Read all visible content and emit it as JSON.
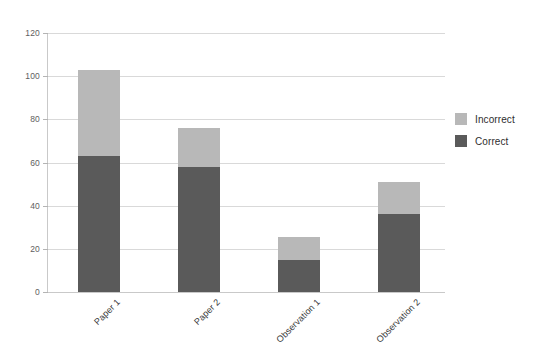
{
  "chart_data": {
    "type": "bar",
    "subtype": "stacked-vertical",
    "title": "",
    "xlabel": "",
    "ylabel": "",
    "ylim": [
      0,
      120
    ],
    "yticks": [
      0,
      20,
      40,
      60,
      80,
      100,
      120
    ],
    "ytick_labels": [
      "0",
      "20",
      "40",
      "60",
      "80",
      "100",
      "120"
    ],
    "grid": true,
    "grid_axis": "y",
    "legend_position": "right",
    "categories": [
      "Paper 1",
      "Paper 2",
      "Observation 1",
      "Observation 2"
    ],
    "series": [
      {
        "name": "Correct",
        "color": "#5a5a5a",
        "values": [
          63,
          58,
          15,
          36
        ]
      },
      {
        "name": "Incorrect",
        "color": "#b8b8b8",
        "values": [
          40,
          18,
          10.5,
          15
        ]
      }
    ],
    "stack_order_bottom_to_top": [
      "Correct",
      "Incorrect"
    ],
    "totals": [
      103,
      76,
      25.5,
      51
    ]
  },
  "legend": {
    "items": [
      {
        "label": "Incorrect",
        "color": "#b8b8b8"
      },
      {
        "label": "Correct",
        "color": "#5a5a5a"
      }
    ]
  },
  "colors": {
    "background": "#ffffff",
    "grid": "#d9d9d9",
    "axis": "#c9c9c9",
    "tick_text": "#5e5e5e",
    "category_text": "#3a3a3a"
  }
}
